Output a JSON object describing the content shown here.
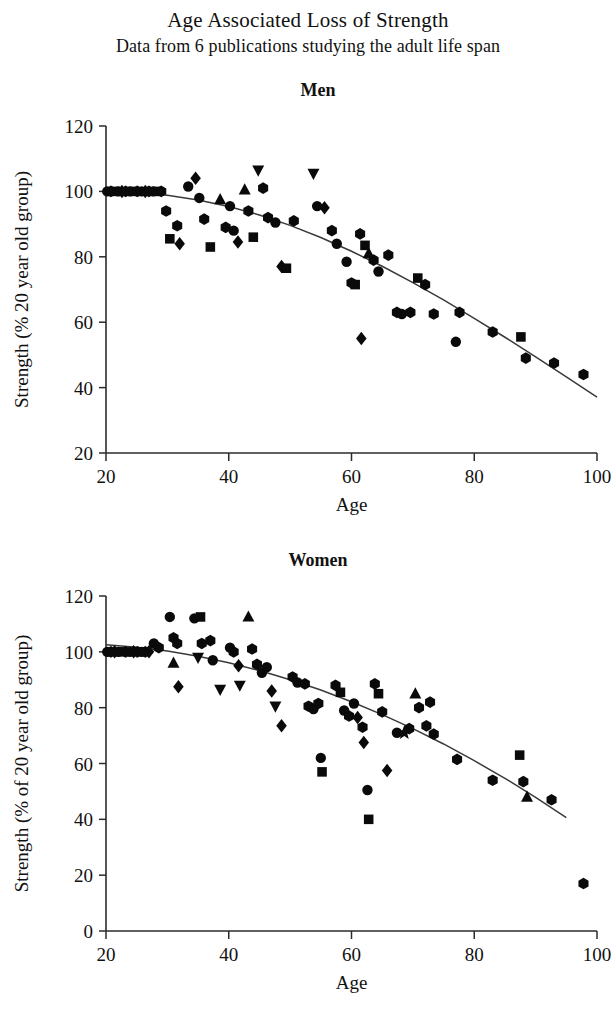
{
  "header": {
    "title": "Age Associated Loss of Strength",
    "subtitle": "Data from 6 publications studying the adult life span"
  },
  "panels": {
    "men": {
      "title": "Men"
    },
    "women": {
      "title": "Women"
    }
  },
  "chart_data": [
    {
      "id": "men",
      "type": "scatter",
      "title": "Men",
      "xlabel": "Age",
      "ylabel": "Strength (% 20 year old group)",
      "xlim": [
        20,
        100
      ],
      "ylim": [
        20,
        120
      ],
      "xticks": [
        20,
        40,
        60,
        80,
        100
      ],
      "yticks": [
        20,
        40,
        60,
        80,
        100,
        120
      ],
      "grid": false,
      "legend": null,
      "marker_color": "#0a0a0a",
      "fit_curve": {
        "label": "fitted trend",
        "x": [
          20,
          25,
          30,
          35,
          40,
          45,
          50,
          55,
          60,
          65,
          70,
          75,
          80,
          85,
          90,
          95,
          100
        ],
        "y": [
          100,
          99.6,
          98.8,
          97.4,
          95.4,
          92.8,
          89.6,
          85.9,
          81.7,
          77.1,
          72.1,
          66.8,
          61.2,
          55.4,
          49.4,
          43.3,
          37.1
        ]
      },
      "points": [
        {
          "x": 20.2,
          "y": 100.0,
          "m": "circle"
        },
        {
          "x": 20.8,
          "y": 100.0,
          "m": "hexagon"
        },
        {
          "x": 21.4,
          "y": 100.0,
          "m": "square"
        },
        {
          "x": 22.0,
          "y": 100.0,
          "m": "circle"
        },
        {
          "x": 22.6,
          "y": 100.0,
          "m": "diamond"
        },
        {
          "x": 23.2,
          "y": 100.0,
          "m": "hexagon"
        },
        {
          "x": 23.9,
          "y": 100.0,
          "m": "circle"
        },
        {
          "x": 24.5,
          "y": 100.0,
          "m": "square"
        },
        {
          "x": 25.1,
          "y": 100.0,
          "m": "hexagon"
        },
        {
          "x": 25.8,
          "y": 100.0,
          "m": "circle"
        },
        {
          "x": 26.4,
          "y": 100.0,
          "m": "diamond"
        },
        {
          "x": 27.0,
          "y": 100.0,
          "m": "hexagon"
        },
        {
          "x": 27.7,
          "y": 100.0,
          "m": "circle"
        },
        {
          "x": 28.3,
          "y": 100.0,
          "m": "square"
        },
        {
          "x": 29.0,
          "y": 100.0,
          "m": "hexagon"
        },
        {
          "x": 29.8,
          "y": 94.0,
          "m": "hexagon"
        },
        {
          "x": 30.4,
          "y": 85.5,
          "m": "square"
        },
        {
          "x": 31.6,
          "y": 89.5,
          "m": "hexagon"
        },
        {
          "x": 32.0,
          "y": 84.0,
          "m": "diamond"
        },
        {
          "x": 33.4,
          "y": 101.5,
          "m": "circle"
        },
        {
          "x": 34.6,
          "y": 104.0,
          "m": "diamond"
        },
        {
          "x": 35.2,
          "y": 98.0,
          "m": "circle"
        },
        {
          "x": 36.0,
          "y": 91.5,
          "m": "hexagon"
        },
        {
          "x": 37.0,
          "y": 83.0,
          "m": "square"
        },
        {
          "x": 38.6,
          "y": 97.5,
          "m": "triangle-up"
        },
        {
          "x": 39.5,
          "y": 89.0,
          "m": "hexagon"
        },
        {
          "x": 40.2,
          "y": 95.5,
          "m": "circle"
        },
        {
          "x": 40.8,
          "y": 88.0,
          "m": "circle"
        },
        {
          "x": 41.5,
          "y": 84.5,
          "m": "diamond"
        },
        {
          "x": 42.6,
          "y": 100.5,
          "m": "triangle-up"
        },
        {
          "x": 43.2,
          "y": 94.0,
          "m": "hexagon"
        },
        {
          "x": 44.0,
          "y": 86.0,
          "m": "square"
        },
        {
          "x": 44.8,
          "y": 106.5,
          "m": "triangle-down"
        },
        {
          "x": 45.6,
          "y": 101.0,
          "m": "hexagon"
        },
        {
          "x": 46.4,
          "y": 92.0,
          "m": "hexagon"
        },
        {
          "x": 47.6,
          "y": 90.5,
          "m": "circle"
        },
        {
          "x": 48.6,
          "y": 77.0,
          "m": "diamond"
        },
        {
          "x": 49.4,
          "y": 76.5,
          "m": "square"
        },
        {
          "x": 50.6,
          "y": 91.0,
          "m": "hexagon"
        },
        {
          "x": 53.8,
          "y": 105.5,
          "m": "triangle-down"
        },
        {
          "x": 54.4,
          "y": 95.5,
          "m": "circle"
        },
        {
          "x": 55.6,
          "y": 95.0,
          "m": "diamond"
        },
        {
          "x": 56.8,
          "y": 88.0,
          "m": "hexagon"
        },
        {
          "x": 57.6,
          "y": 84.0,
          "m": "circle"
        },
        {
          "x": 59.2,
          "y": 78.5,
          "m": "circle"
        },
        {
          "x": 60.0,
          "y": 72.0,
          "m": "hexagon"
        },
        {
          "x": 60.6,
          "y": 71.5,
          "m": "square"
        },
        {
          "x": 61.4,
          "y": 87.0,
          "m": "hexagon"
        },
        {
          "x": 62.2,
          "y": 83.5,
          "m": "square"
        },
        {
          "x": 62.8,
          "y": 81.0,
          "m": "triangle-up"
        },
        {
          "x": 63.6,
          "y": 79.0,
          "m": "hexagon"
        },
        {
          "x": 64.4,
          "y": 75.5,
          "m": "circle"
        },
        {
          "x": 61.6,
          "y": 55.0,
          "m": "diamond"
        },
        {
          "x": 66.0,
          "y": 80.5,
          "m": "hexagon"
        },
        {
          "x": 67.4,
          "y": 63.0,
          "m": "hexagon"
        },
        {
          "x": 68.2,
          "y": 62.5,
          "m": "circle"
        },
        {
          "x": 69.6,
          "y": 63.0,
          "m": "hexagon"
        },
        {
          "x": 70.8,
          "y": 73.5,
          "m": "square"
        },
        {
          "x": 72.0,
          "y": 71.5,
          "m": "hexagon"
        },
        {
          "x": 73.4,
          "y": 62.5,
          "m": "hexagon"
        },
        {
          "x": 77.0,
          "y": 54.0,
          "m": "circle"
        },
        {
          "x": 77.6,
          "y": 63.0,
          "m": "hexagon"
        },
        {
          "x": 83.0,
          "y": 57.0,
          "m": "hexagon"
        },
        {
          "x": 87.6,
          "y": 55.5,
          "m": "square"
        },
        {
          "x": 88.4,
          "y": 49.0,
          "m": "hexagon"
        },
        {
          "x": 93.0,
          "y": 47.5,
          "m": "hexagon"
        },
        {
          "x": 97.8,
          "y": 44.0,
          "m": "hexagon"
        }
      ]
    },
    {
      "id": "women",
      "type": "scatter",
      "title": "Women",
      "xlabel": "Age",
      "ylabel": "Strength (% of 20 year old group)",
      "xlim": [
        20,
        100
      ],
      "ylim": [
        0,
        120
      ],
      "xticks": [
        20,
        40,
        60,
        80,
        100
      ],
      "yticks": [
        0,
        20,
        40,
        60,
        80,
        100,
        120
      ],
      "grid": false,
      "legend": null,
      "marker_color": "#0a0a0a",
      "fit_curve": {
        "label": "fitted trend",
        "x": [
          20,
          25,
          30,
          35,
          40,
          45,
          50,
          55,
          60,
          65,
          70,
          75,
          80,
          85,
          90,
          95
        ],
        "y": [
          102.5,
          101.6,
          100.3,
          98.4,
          96.1,
          93.3,
          90.0,
          86.3,
          82.1,
          77.5,
          72.5,
          67.0,
          61.0,
          54.7,
          47.9,
          40.6
        ]
      },
      "points": [
        {
          "x": 20.2,
          "y": 100.0,
          "m": "circle"
        },
        {
          "x": 20.8,
          "y": 100.0,
          "m": "hexagon"
        },
        {
          "x": 21.4,
          "y": 100.0,
          "m": "diamond"
        },
        {
          "x": 22.0,
          "y": 100.0,
          "m": "circle"
        },
        {
          "x": 22.6,
          "y": 100.0,
          "m": "square"
        },
        {
          "x": 23.2,
          "y": 100.0,
          "m": "hexagon"
        },
        {
          "x": 23.9,
          "y": 100.0,
          "m": "circle"
        },
        {
          "x": 24.5,
          "y": 100.0,
          "m": "diamond"
        },
        {
          "x": 25.1,
          "y": 100.0,
          "m": "hexagon"
        },
        {
          "x": 25.8,
          "y": 100.0,
          "m": "circle"
        },
        {
          "x": 26.4,
          "y": 100.0,
          "m": "hexagon"
        },
        {
          "x": 27.0,
          "y": 100.0,
          "m": "diamond"
        },
        {
          "x": 27.8,
          "y": 103.0,
          "m": "circle"
        },
        {
          "x": 28.6,
          "y": 101.5,
          "m": "hexagon"
        },
        {
          "x": 30.4,
          "y": 112.5,
          "m": "circle"
        },
        {
          "x": 31.0,
          "y": 105.0,
          "m": "hexagon"
        },
        {
          "x": 31.6,
          "y": 103.0,
          "m": "hexagon"
        },
        {
          "x": 31.0,
          "y": 96.0,
          "m": "triangle-up"
        },
        {
          "x": 31.8,
          "y": 87.5,
          "m": "diamond"
        },
        {
          "x": 34.4,
          "y": 112.0,
          "m": "circle"
        },
        {
          "x": 35.4,
          "y": 112.5,
          "m": "square"
        },
        {
          "x": 35.6,
          "y": 103.0,
          "m": "hexagon"
        },
        {
          "x": 35.0,
          "y": 98.0,
          "m": "triangle-down"
        },
        {
          "x": 37.0,
          "y": 104.0,
          "m": "hexagon"
        },
        {
          "x": 37.4,
          "y": 97.0,
          "m": "circle"
        },
        {
          "x": 38.6,
          "y": 86.5,
          "m": "triangle-down"
        },
        {
          "x": 40.2,
          "y": 101.5,
          "m": "circle"
        },
        {
          "x": 40.8,
          "y": 100.0,
          "m": "hexagon"
        },
        {
          "x": 41.6,
          "y": 95.0,
          "m": "diamond"
        },
        {
          "x": 41.8,
          "y": 88.0,
          "m": "triangle-down"
        },
        {
          "x": 43.2,
          "y": 112.5,
          "m": "triangle-up"
        },
        {
          "x": 43.8,
          "y": 101.0,
          "m": "hexagon"
        },
        {
          "x": 44.6,
          "y": 95.5,
          "m": "hexagon"
        },
        {
          "x": 45.4,
          "y": 92.5,
          "m": "circle"
        },
        {
          "x": 46.2,
          "y": 94.5,
          "m": "circle"
        },
        {
          "x": 47.0,
          "y": 86.0,
          "m": "diamond"
        },
        {
          "x": 47.6,
          "y": 80.5,
          "m": "triangle-down"
        },
        {
          "x": 48.6,
          "y": 73.5,
          "m": "diamond"
        },
        {
          "x": 50.4,
          "y": 91.0,
          "m": "hexagon"
        },
        {
          "x": 51.2,
          "y": 89.0,
          "m": "circle"
        },
        {
          "x": 52.4,
          "y": 88.5,
          "m": "hexagon"
        },
        {
          "x": 53.0,
          "y": 80.5,
          "m": "hexagon"
        },
        {
          "x": 53.8,
          "y": 79.5,
          "m": "circle"
        },
        {
          "x": 54.6,
          "y": 81.5,
          "m": "hexagon"
        },
        {
          "x": 55.0,
          "y": 62.0,
          "m": "circle"
        },
        {
          "x": 55.2,
          "y": 57.0,
          "m": "square"
        },
        {
          "x": 57.4,
          "y": 88.0,
          "m": "hexagon"
        },
        {
          "x": 58.2,
          "y": 85.5,
          "m": "square"
        },
        {
          "x": 58.8,
          "y": 79.0,
          "m": "circle"
        },
        {
          "x": 59.6,
          "y": 77.0,
          "m": "hexagon"
        },
        {
          "x": 60.4,
          "y": 81.5,
          "m": "circle"
        },
        {
          "x": 61.0,
          "y": 76.5,
          "m": "diamond"
        },
        {
          "x": 61.8,
          "y": 73.0,
          "m": "hexagon"
        },
        {
          "x": 62.0,
          "y": 67.5,
          "m": "diamond"
        },
        {
          "x": 62.6,
          "y": 50.5,
          "m": "circle"
        },
        {
          "x": 62.8,
          "y": 40.0,
          "m": "square"
        },
        {
          "x": 63.8,
          "y": 88.5,
          "m": "hexagon"
        },
        {
          "x": 64.4,
          "y": 85.0,
          "m": "square"
        },
        {
          "x": 65.0,
          "y": 78.5,
          "m": "hexagon"
        },
        {
          "x": 65.8,
          "y": 57.5,
          "m": "diamond"
        },
        {
          "x": 67.4,
          "y": 71.0,
          "m": "circle"
        },
        {
          "x": 68.6,
          "y": 71.0,
          "m": "star"
        },
        {
          "x": 69.4,
          "y": 72.5,
          "m": "hexagon"
        },
        {
          "x": 70.4,
          "y": 85.0,
          "m": "triangle-up"
        },
        {
          "x": 71.0,
          "y": 80.0,
          "m": "hexagon"
        },
        {
          "x": 72.2,
          "y": 73.5,
          "m": "hexagon"
        },
        {
          "x": 72.8,
          "y": 82.0,
          "m": "hexagon"
        },
        {
          "x": 73.4,
          "y": 70.5,
          "m": "hexagon"
        },
        {
          "x": 77.2,
          "y": 61.5,
          "m": "hexagon"
        },
        {
          "x": 83.0,
          "y": 54.0,
          "m": "hexagon"
        },
        {
          "x": 87.4,
          "y": 63.0,
          "m": "square"
        },
        {
          "x": 88.0,
          "y": 53.5,
          "m": "hexagon"
        },
        {
          "x": 88.6,
          "y": 48.0,
          "m": "triangle-up"
        },
        {
          "x": 92.6,
          "y": 47.0,
          "m": "hexagon"
        },
        {
          "x": 97.8,
          "y": 17.0,
          "m": "hexagon"
        }
      ]
    }
  ]
}
